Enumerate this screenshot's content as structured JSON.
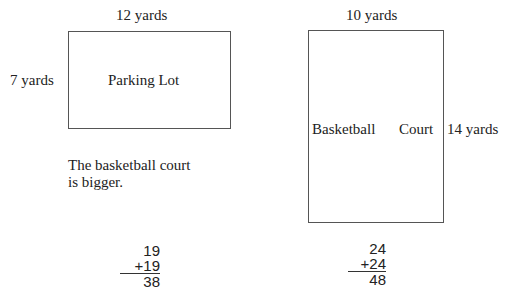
{
  "parking_lot": {
    "name": "Parking Lot",
    "width_label": "12 yards",
    "height_label": "7 yards",
    "width": 12,
    "height": 7
  },
  "basketball_court": {
    "name_part1": "Basketball",
    "name_part2": "Court",
    "width_label": "10 yards",
    "height_label": "14 yards",
    "width": 10,
    "height": 14
  },
  "conclusion": {
    "line1": "The basketball court",
    "line2": "is bigger."
  },
  "sums": [
    {
      "addend": "19",
      "plus_addend": "+19",
      "total": "38"
    },
    {
      "addend": "24",
      "plus_addend": "+24",
      "total": "48"
    }
  ]
}
